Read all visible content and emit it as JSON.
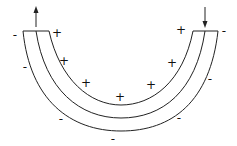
{
  "diagram": {
    "colors": {
      "stroke": "#222222",
      "background": "#ffffff"
    },
    "arrows": [
      {
        "name": "up-arrow-left",
        "direction": "up"
      },
      {
        "name": "down-arrow-right",
        "direction": "down"
      }
    ],
    "signs": [
      {
        "text": "-",
        "x": 15,
        "y": 35
      },
      {
        "text": "+",
        "x": 57,
        "y": 33
      },
      {
        "text": "-",
        "x": 25,
        "y": 67
      },
      {
        "text": "+",
        "x": 64,
        "y": 61
      },
      {
        "text": "+",
        "x": 86,
        "y": 83
      },
      {
        "text": "-",
        "x": 61,
        "y": 119
      },
      {
        "text": "+",
        "x": 120,
        "y": 97
      },
      {
        "text": "-",
        "x": 113,
        "y": 139
      },
      {
        "text": "+",
        "x": 151,
        "y": 85
      },
      {
        "text": "-",
        "x": 179,
        "y": 118
      },
      {
        "text": "+",
        "x": 172,
        "y": 63
      },
      {
        "text": "-",
        "x": 210,
        "y": 79
      },
      {
        "text": "+",
        "x": 181,
        "y": 30
      },
      {
        "text": "-",
        "x": 224,
        "y": 31
      }
    ]
  }
}
